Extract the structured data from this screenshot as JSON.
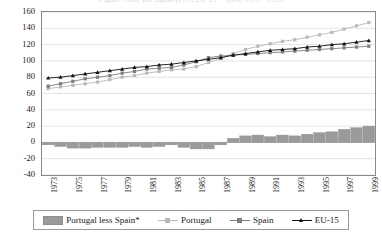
{
  "chart_data": {
    "type": "line",
    "title": "Figure: GDP per capita (PPS, EU-15 = 100), 1973 - 1999",
    "xlabel": "",
    "ylabel": "",
    "ylim": [
      -40,
      160
    ],
    "ytick_step": 20,
    "yticks": [
      "160",
      "140",
      "120",
      "100",
      "80",
      "60",
      "40",
      "20",
      "0",
      "-20",
      "-40"
    ],
    "grid": true,
    "legend_position": "bottom",
    "x": [
      1973,
      1974,
      1975,
      1976,
      1977,
      1978,
      1979,
      1980,
      1981,
      1982,
      1983,
      1984,
      1985,
      1986,
      1987,
      1988,
      1989,
      1990,
      1991,
      1992,
      1993,
      1994,
      1995,
      1996,
      1997,
      1998,
      1999
    ],
    "xtick_labels": [
      "1973",
      "1975",
      "1977",
      "1979",
      "1981",
      "1983",
      "1985",
      "1987",
      "1989",
      "1991",
      "1993",
      "1995",
      "1997",
      "1999"
    ],
    "series": [
      {
        "name": "Portugal less Spain*",
        "type": "bar",
        "color": "#9a9a9a",
        "values": [
          -3,
          -5,
          -7,
          -7,
          -6,
          -6,
          -6,
          -5,
          -6,
          -5,
          -3,
          -6,
          -8,
          -8,
          -3,
          5,
          8,
          9,
          7,
          9,
          8,
          10,
          12,
          13,
          16,
          18,
          20
        ]
      },
      {
        "name": "Portugal",
        "type": "line",
        "color": "#b9b9b9",
        "marker": "square",
        "values": [
          66,
          68,
          70,
          72,
          74,
          77,
          80,
          82,
          85,
          87,
          89,
          90,
          93,
          98,
          103,
          109,
          114,
          118,
          121,
          124,
          126,
          129,
          132,
          135,
          139,
          143,
          147
        ]
      },
      {
        "name": "Spain",
        "type": "line",
        "color": "#7d7d7d",
        "marker": "square",
        "values": [
          69,
          72,
          75,
          78,
          80,
          82,
          85,
          87,
          90,
          91,
          92,
          95,
          99,
          104,
          106,
          107,
          108,
          109,
          110,
          111,
          112,
          113,
          114,
          115,
          116,
          117,
          118
        ]
      },
      {
        "name": "EU-15",
        "type": "line",
        "color": "#111111",
        "marker": "triangle",
        "values": [
          79,
          80,
          82,
          84,
          86,
          88,
          90,
          92,
          93,
          95,
          96,
          98,
          100,
          102,
          104,
          107,
          109,
          111,
          113,
          114,
          115,
          117,
          118,
          120,
          121,
          123,
          125
        ]
      }
    ]
  },
  "legend": {
    "items": [
      {
        "label": "Portugal less Spain*",
        "kind": "bar",
        "color": "#9a9a9a"
      },
      {
        "label": "Portugal",
        "kind": "line",
        "color": "#b9b9b9"
      },
      {
        "label": "Spain",
        "kind": "line",
        "color": "#7d7d7d"
      },
      {
        "label": "EU-15",
        "kind": "line",
        "color": "#111111"
      }
    ]
  },
  "colors": {
    "frame": "#8a8a8a",
    "grid": "#d0d0d0",
    "zero_line": "#b0b0b0",
    "background": "#ffffff",
    "text": "#1a1a1a"
  }
}
